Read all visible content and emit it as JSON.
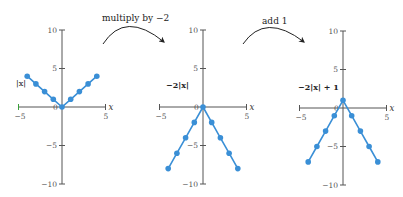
{
  "transforms": [
    {
      "label": "multiply by −2"
    },
    {
      "label": "add 1"
    }
  ],
  "graphs": [
    {
      "fn_label": "|x|",
      "bold": false
    },
    {
      "fn_label": "−2|x|",
      "bold": true
    },
    {
      "fn_label": "−2|x| + 1",
      "bold": true
    }
  ],
  "axes": {
    "x_label": "x",
    "x_ticks": [
      "−5",
      "0",
      "5"
    ],
    "y_ticks": [
      "10",
      "5",
      "−5",
      "−10"
    ]
  },
  "colors": {
    "series": "#3a8fd6",
    "axis": "#555555",
    "arrow": "#222222",
    "x_axis_left_tick": "#3aa23a"
  },
  "chart_data": [
    {
      "type": "scatter",
      "title": "|x|",
      "x": [
        -4,
        -3,
        -2,
        -1,
        0,
        1,
        2,
        3,
        4
      ],
      "y": [
        4,
        3,
        2,
        1,
        0,
        1,
        2,
        3,
        4
      ],
      "xlim": [
        -5,
        5
      ],
      "ylim": [
        -10,
        10
      ],
      "xlabel": "x",
      "ylabel": "",
      "lines": true,
      "grid": false
    },
    {
      "type": "scatter",
      "title": "−2|x|",
      "x": [
        -4,
        -3,
        -2,
        -1,
        0,
        1,
        2,
        3,
        4
      ],
      "y": [
        -8,
        -6,
        -4,
        -2,
        0,
        -2,
        -4,
        -6,
        -8
      ],
      "xlim": [
        -5,
        5
      ],
      "ylim": [
        -10,
        10
      ],
      "xlabel": "x",
      "ylabel": "",
      "lines": true,
      "grid": false
    },
    {
      "type": "scatter",
      "title": "−2|x| + 1",
      "x": [
        -4,
        -3,
        -2,
        -1,
        0,
        1,
        2,
        3,
        4
      ],
      "y": [
        -7,
        -5,
        -3,
        -1,
        1,
        -1,
        -3,
        -5,
        -7
      ],
      "xlim": [
        -5,
        5
      ],
      "ylim": [
        -10,
        10
      ],
      "xlabel": "x",
      "ylabel": "",
      "lines": true,
      "grid": false
    }
  ]
}
